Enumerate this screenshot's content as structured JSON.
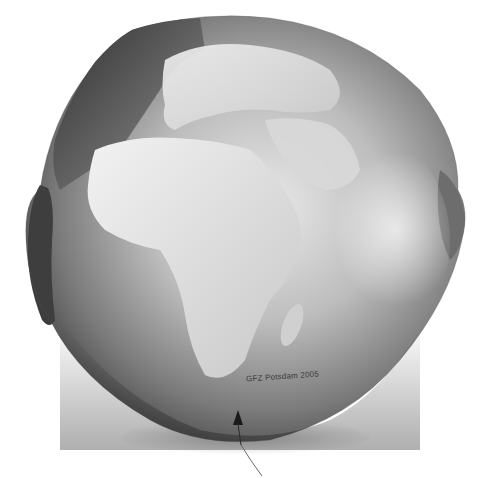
{
  "image": {
    "subject": "Geoid (Potsdam Gravity Potato) centered on Africa and Europe",
    "style": "grayscale shaded relief",
    "credit_text": "GFZ Potsdam 2005",
    "colors": {
      "background": "#ffffff",
      "ocean_dark": "#3c3c3c",
      "ocean_mid": "#8a8a8a",
      "land_light": "#e6e6e6",
      "highlight": "#f4f4f4"
    }
  }
}
